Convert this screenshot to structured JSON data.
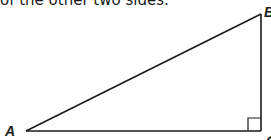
{
  "caption": {
    "text": "of the other two sides."
  },
  "figure": {
    "type": "right-triangle",
    "stroke_color": "#1a1a1a",
    "vertices": {
      "A": {
        "label": "A",
        "x": 26,
        "y": 131
      },
      "B": {
        "label": "B",
        "x": 261,
        "y": 14
      },
      "C": {
        "label": "C",
        "x": 261,
        "y": 131
      }
    },
    "right_angle_at": "C"
  }
}
